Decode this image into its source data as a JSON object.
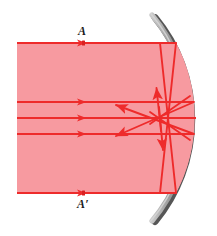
{
  "figure": {
    "type": "optics-ray-diagram",
    "width": 217,
    "height": 236,
    "background": "#ffffff"
  },
  "labels": {
    "top": "A",
    "bottom": "A′"
  },
  "colors": {
    "beam_fill": "#f79aa0",
    "ray_stroke": "#ee2b2b",
    "ray_stroke_dark": "#e01f1f",
    "mirror_face": "#9a9a9a",
    "mirror_shadow": "#4a4a4a",
    "mirror_highlight": "#c9c9c9",
    "label_text": "#1a1a1a"
  },
  "mirror": {
    "name": "concave-mirror-arc",
    "opening": "left",
    "vertex": {
      "x": 196,
      "y": 118
    },
    "center_x": 36,
    "radius": 160,
    "top_end": {
      "x": 152,
      "y": 14
    },
    "bottom_end": {
      "x": 152,
      "y": 222
    },
    "face_width": 4,
    "shadow_width": 3
  },
  "beam": {
    "name": "incident-beam-region",
    "left_x": 17,
    "top_y": 43,
    "bottom_y": 193,
    "fill": "#f79aa0"
  },
  "incident_rays": [
    {
      "id": "ray-A",
      "y": 43,
      "x_start": 17,
      "x_end": 176,
      "arrow_x": 82,
      "label": "A"
    },
    {
      "id": "ray-2",
      "y": 102,
      "x_start": 17,
      "x_end": 196,
      "arrow_x": 82,
      "label": ""
    },
    {
      "id": "ray-3",
      "y": 118,
      "x_start": 17,
      "x_end": 196,
      "arrow_x": 82,
      "label": ""
    },
    {
      "id": "ray-4",
      "y": 134,
      "x_start": 17,
      "x_end": 193,
      "arrow_x": 82,
      "label": ""
    },
    {
      "id": "ray-Ap",
      "y": 193,
      "x_start": 17,
      "x_end": 176,
      "arrow_x": 82,
      "label": "A′"
    }
  ],
  "reflected_rays": [
    {
      "id": "refl-A-down",
      "from": {
        "x": 176,
        "y": 43
      },
      "to": {
        "x": 160,
        "y": 193
      },
      "arrow": "none"
    },
    {
      "id": "refl-Ap-up",
      "from": {
        "x": 176,
        "y": 193
      },
      "to": {
        "x": 160,
        "y": 43
      },
      "arrow": "none"
    },
    {
      "id": "refl-2-left",
      "from": {
        "x": 196,
        "y": 102
      },
      "to": {
        "x": 113,
        "y": 137
      },
      "arrow": "end"
    },
    {
      "id": "refl-4-left",
      "from": {
        "x": 193,
        "y": 134
      },
      "to": {
        "x": 113,
        "y": 104
      },
      "arrow": "end"
    },
    {
      "id": "refl-vert-up",
      "from": {
        "x": 160,
        "y": 130
      },
      "to": {
        "x": 156,
        "y": 86
      },
      "arrow": "end"
    },
    {
      "id": "refl-vert-dn",
      "from": {
        "x": 160,
        "y": 108
      },
      "to": {
        "x": 156,
        "y": 152
      },
      "arrow": "end"
    }
  ],
  "annotations": {
    "focal_region": "caustic crossing zone near x 140-170, y 110-128",
    "axis_ray": "ray-3 is the principal axis ray"
  }
}
